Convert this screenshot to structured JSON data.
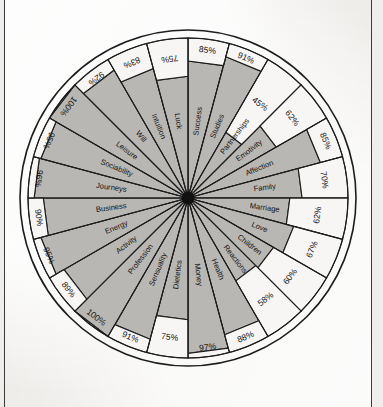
{
  "document": {
    "title": "Life Wheel Radar Diagram",
    "media": "scanned-page"
  },
  "chart_data": {
    "type": "radar",
    "title": "",
    "subtitle": "",
    "xlabel": "",
    "ylabel": "",
    "grid": false,
    "legend": "none",
    "rlim": [
      0,
      100
    ],
    "units": "%",
    "value_suffix": "%",
    "start_angle_deg": -90,
    "direction": "clockwise",
    "sector_count": 24,
    "categories": [
      "Success",
      "Studies",
      "Partnerships",
      "Emotivity",
      "Affection",
      "Family",
      "Marriage",
      "Love",
      "Children",
      "Reactions",
      "Health",
      "Money",
      "Dietetics",
      "Sensuality",
      "Profession",
      "Activity",
      "Energy",
      "Business",
      "Journeys",
      "Sociability",
      "Leisure",
      "Will",
      "Intuition",
      "Luck"
    ],
    "values": [
      85,
      91,
      45,
      62,
      85,
      70,
      62,
      67,
      60,
      58,
      88,
      97,
      75,
      91,
      100,
      89,
      95,
      90,
      96,
      95,
      100,
      92,
      83,
      75
    ],
    "value_labels": [
      "85%",
      "91%",
      "45%",
      "62%",
      "85%",
      "70%",
      "62%",
      "67%",
      "60%",
      "58%",
      "88%",
      "97%",
      "75%",
      "91%",
      "100%",
      "89%",
      "95%",
      "90%",
      "96%",
      "95%",
      "100%",
      "92%",
      "83%",
      "75%"
    ],
    "colors": {
      "filled": "#b9b7b3",
      "empty": "#f7f6f4",
      "stroke": "#1d1d1d",
      "paper": "#f3f2f0"
    }
  }
}
